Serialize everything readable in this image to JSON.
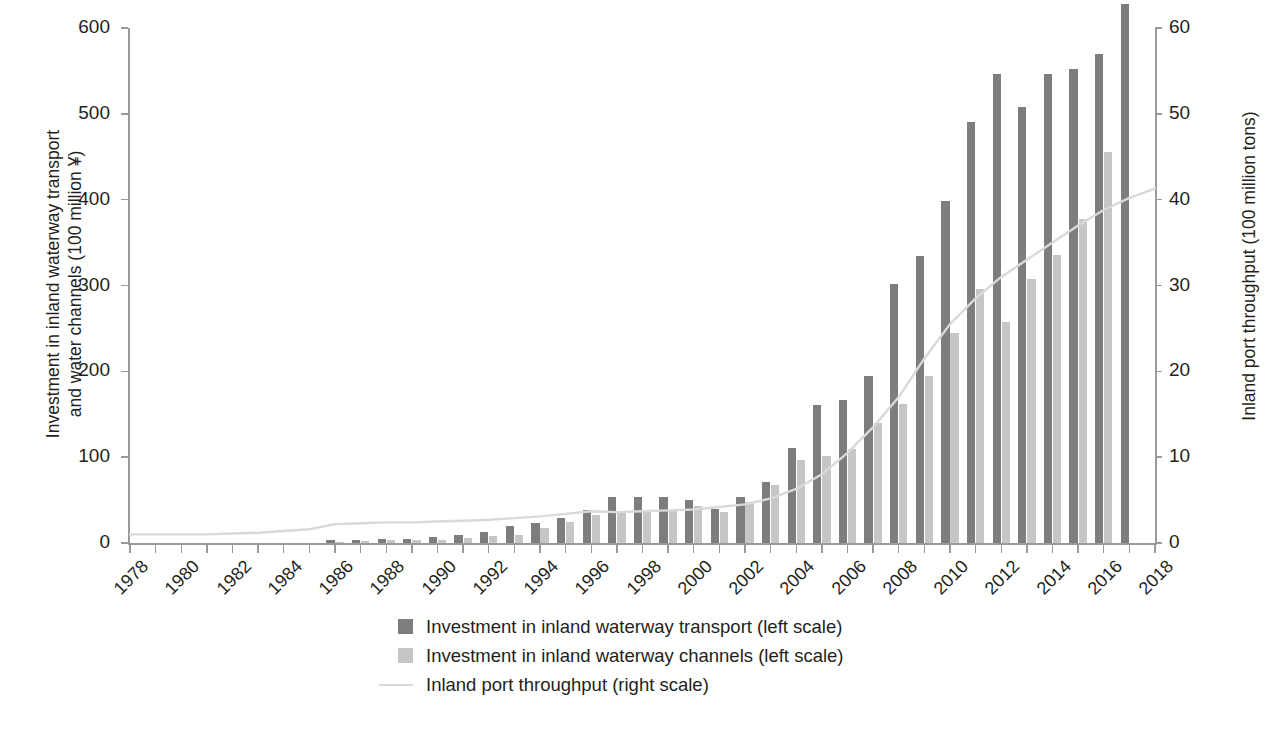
{
  "chart_data": {
    "type": "bar",
    "title": "",
    "xlabel": "",
    "ylabel": "Investment in inland waterway transport\nand water channels (100 million ¥)",
    "y2label": "Inland port throughput (100 million tons)",
    "ylim": [
      0,
      600
    ],
    "y2lim": [
      0,
      60
    ],
    "yticks": [
      0,
      100,
      200,
      300,
      400,
      500,
      600
    ],
    "y2ticks": [
      0,
      10,
      20,
      30,
      40,
      50,
      60
    ],
    "grid": false,
    "legend_position": "bottom-center",
    "categories": [
      1978,
      1979,
      1980,
      1981,
      1982,
      1983,
      1984,
      1985,
      1986,
      1987,
      1988,
      1989,
      1990,
      1991,
      1992,
      1993,
      1994,
      1995,
      1996,
      1997,
      1998,
      1999,
      2000,
      2001,
      2002,
      2003,
      2004,
      2005,
      2006,
      2007,
      2008,
      2009,
      2010,
      2011,
      2012,
      2013,
      2014,
      2015,
      2016,
      2017,
      2018
    ],
    "xtick_labels": [
      "1978",
      "1980",
      "1982",
      "1984",
      "1986",
      "1988",
      "1990",
      "1992",
      "1994",
      "1996",
      "1998",
      "2000",
      "2002",
      "2004",
      "2006",
      "2008",
      "2010",
      "2012",
      "2014",
      "2016",
      "2018"
    ],
    "series": [
      {
        "name": "Investment in inland waterway transport (left scale)",
        "axis": "left",
        "color": "#7d7d7d",
        "type": "bar",
        "values": [
          0,
          0,
          0,
          0,
          0,
          0,
          0,
          0,
          3,
          4,
          5,
          5,
          7,
          9,
          13,
          20,
          23,
          29,
          38,
          54,
          54,
          54,
          50,
          40,
          54,
          71,
          111,
          161,
          167,
          195,
          302,
          334,
          398,
          490,
          547,
          508,
          547,
          552,
          570,
          628,
          0
        ]
      },
      {
        "name": "Investment in inland waterway channels (left scale)",
        "axis": "left",
        "color": "#c6c6c6",
        "type": "bar",
        "values": [
          0,
          0,
          0,
          0,
          0,
          0,
          0,
          0,
          1,
          2,
          3,
          3,
          4,
          6,
          8,
          9,
          17,
          25,
          33,
          36,
          38,
          38,
          43,
          36,
          48,
          68,
          97,
          101,
          110,
          140,
          162,
          195,
          245,
          296,
          258,
          308,
          335,
          377,
          455,
          0,
          0
        ]
      },
      {
        "name": "Inland port throughput (right scale)",
        "axis": "right",
        "color": "#d9d9d9",
        "type": "line",
        "values": [
          1.0,
          1.0,
          1.0,
          1.0,
          1.1,
          1.2,
          1.4,
          1.6,
          2.2,
          2.3,
          2.4,
          2.4,
          2.5,
          2.6,
          2.7,
          2.9,
          3.1,
          3.4,
          3.7,
          3.6,
          3.7,
          3.8,
          3.9,
          4.2,
          4.5,
          5.2,
          6.3,
          8.0,
          10.5,
          13.5,
          17.0,
          21.5,
          25.5,
          28.5,
          31.0,
          33.0,
          35.0,
          37.0,
          38.8,
          40.2,
          41.3
        ]
      }
    ]
  },
  "legend": {
    "items": [
      {
        "swatch": "dark",
        "label": "Investment in inland waterway transport (left scale)"
      },
      {
        "swatch": "light",
        "label": "Investment in inland waterway channels (left scale)"
      },
      {
        "swatch": "line",
        "label": "Inland port throughput (right scale)"
      }
    ]
  },
  "axes": {
    "left_title": "Investment in inland waterway transport\nand water channels (100 million ¥)",
    "right_title": "Inland port throughput (100 million tons)"
  }
}
